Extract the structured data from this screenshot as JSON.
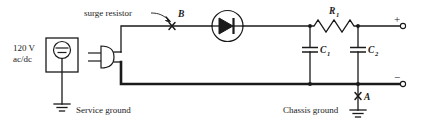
{
  "diagram": {
    "type": "electrical-schematic",
    "background_color": "#ffffff",
    "line_color": "#1a1a1a"
  },
  "labels": {
    "source_voltage_line1": "120 V",
    "source_voltage_line2": "ac/dc",
    "surge_resistor": "surge resistor",
    "point_b": "B",
    "point_a": "A",
    "resistor_r1": "R",
    "resistor_r1_sub": "1",
    "capacitor_c1": "C",
    "capacitor_c1_sub": "1",
    "capacitor_c2": "C",
    "capacitor_c2_sub": "2",
    "service_ground": "Service ground",
    "chassis_ground": "Chassis ground",
    "terminal_positive": "+",
    "terminal_negative": "−"
  },
  "components": [
    {
      "id": "source",
      "name": "120 V ac/dc source",
      "symbol": "circled-ac-dc-source"
    },
    {
      "id": "plug",
      "name": "line plug connector",
      "symbol": "plug"
    },
    {
      "id": "surge-marker",
      "name": "surge resistor test point B",
      "symbol": "x-marker"
    },
    {
      "id": "diode",
      "name": "rectifier diode",
      "symbol": "circled-diode"
    },
    {
      "id": "r1",
      "name": "filter resistor R1",
      "symbol": "zigzag-resistor"
    },
    {
      "id": "c1",
      "name": "filter capacitor C1",
      "symbol": "capacitor"
    },
    {
      "id": "c2",
      "name": "filter capacitor C2",
      "symbol": "capacitor"
    },
    {
      "id": "service-gnd",
      "name": "service ground",
      "symbol": "earth-ground"
    },
    {
      "id": "chassis-gnd",
      "name": "chassis ground",
      "symbol": "earth-ground"
    },
    {
      "id": "chassis-marker",
      "name": "chassis test point A",
      "symbol": "x-marker"
    },
    {
      "id": "out-pos",
      "name": "positive output terminal",
      "symbol": "open-circle-terminal"
    },
    {
      "id": "out-neg",
      "name": "negative output terminal",
      "symbol": "open-circle-terminal"
    }
  ]
}
